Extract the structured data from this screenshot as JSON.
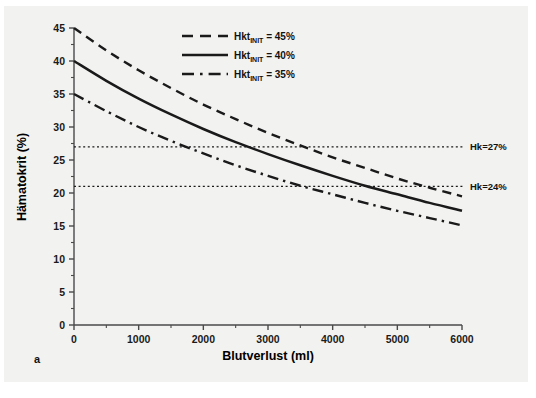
{
  "figure": {
    "panel_letter": "a",
    "background_color": "#f2f2f1",
    "ink_color": "#1a1a1a"
  },
  "chart_data": {
    "type": "line",
    "title": "",
    "xlabel": "Blutverlust (ml)",
    "ylabel": "Hämatokrit (%)",
    "xlim": [
      0,
      6000
    ],
    "ylim": [
      0,
      45
    ],
    "xticks": [
      0,
      1000,
      2000,
      3000,
      4000,
      5000,
      6000
    ],
    "xtick_labels": [
      "0",
      "1000",
      "2000",
      "3000",
      "4000",
      "5000",
      "6000"
    ],
    "yticks": [
      0,
      5,
      10,
      15,
      20,
      25,
      30,
      35,
      40,
      45
    ],
    "ytick_labels": [
      "0",
      "5",
      "10",
      "15",
      "20",
      "25",
      "30",
      "35",
      "40",
      "45"
    ],
    "minor_yticks": [
      2.5,
      7.5,
      12.5,
      17.5,
      22.5,
      27.5,
      32.5,
      37.5,
      42.5
    ],
    "minor_xticks": [
      500,
      1500,
      2500,
      3500,
      4500,
      5500
    ],
    "grid": false,
    "legend_position": "top-right",
    "x": [
      0,
      500,
      1000,
      1500,
      2000,
      2500,
      3000,
      3500,
      4000,
      4500,
      5000,
      5500,
      6000
    ],
    "series": [
      {
        "name": "Hkt_INIT = 45%",
        "label_main": "Hkt",
        "label_sub": "INIT",
        "label_value": "= 45%",
        "style": "dashed",
        "initial_hkt": 45,
        "values": [
          45.0,
          41.6,
          38.6,
          35.9,
          33.4,
          31.2,
          29.1,
          27.2,
          25.4,
          23.8,
          22.2,
          20.8,
          19.5
        ]
      },
      {
        "name": "Hkt_INIT = 40%",
        "label_main": "Hkt",
        "label_sub": "INIT",
        "label_value": "= 40%",
        "style": "solid",
        "initial_hkt": 40,
        "values": [
          40.0,
          37.0,
          34.3,
          31.9,
          29.7,
          27.7,
          25.9,
          24.2,
          22.6,
          21.1,
          19.8,
          18.5,
          17.3
        ]
      },
      {
        "name": "Hkt_INIT = 35%",
        "label_main": "Hkt",
        "label_sub": "INIT",
        "label_value": "= 35%",
        "style": "dashdot",
        "initial_hkt": 35,
        "values": [
          35.0,
          32.4,
          30.0,
          27.9,
          26.0,
          24.2,
          22.6,
          21.1,
          19.8,
          18.5,
          17.3,
          16.2,
          15.1
        ]
      }
    ],
    "reference_lines": [
      {
        "name": "Hk=27%",
        "label": "Hk=27%",
        "value": 27,
        "orientation": "horizontal",
        "style": "dotted"
      },
      {
        "name": "Hk=24%",
        "label": "Hk=24%",
        "value": 21,
        "orientation": "horizontal",
        "style": "dotted"
      }
    ],
    "annotations": [
      {
        "name": "panel-letter",
        "text": "a",
        "x": 40,
        "y": 1.5
      }
    ]
  },
  "ghost": {
    "line1": "",
    "line2": ""
  }
}
